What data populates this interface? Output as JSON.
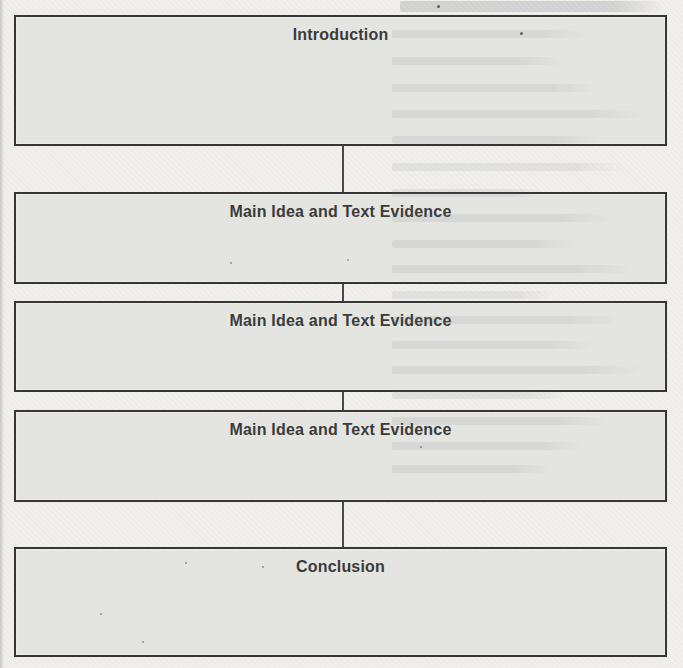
{
  "flowchart": {
    "boxes": [
      {
        "label": "Introduction"
      },
      {
        "label": "Main Idea and Text Evidence"
      },
      {
        "label": "Main Idea and Text Evidence"
      },
      {
        "label": "Main Idea and Text Evidence"
      },
      {
        "label": "Conclusion"
      }
    ]
  },
  "colors": {
    "page_background": "#f0efec",
    "box_fill": "#e4e5e1",
    "box_border": "#363636",
    "title_text": "#3b3b3b",
    "connector": "#4a4a4a"
  }
}
